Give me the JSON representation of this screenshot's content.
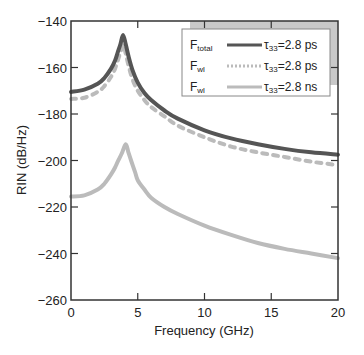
{
  "chart_data": {
    "type": "line",
    "title": "",
    "xlabel": "Frequency (GHz)",
    "ylabel": "RIN (dB/Hz)",
    "xlim": [
      0,
      20
    ],
    "ylim": [
      -260,
      -140
    ],
    "xticks": [
      0,
      5,
      10,
      15,
      20
    ],
    "yticks": [
      -140,
      -160,
      -180,
      -200,
      -220,
      -240,
      -260
    ],
    "xtick_labels": [
      "0",
      "5",
      "10",
      "15",
      "20"
    ],
    "ytick_labels": [
      "−140",
      "−160",
      "−180",
      "−200",
      "−220",
      "−240",
      "−260"
    ],
    "grid": false,
    "legend_position": "upper right",
    "series": [
      {
        "name": "F_total τ33=2.8 ps",
        "legend_symbol": "F",
        "legend_sub": "total",
        "legend_label": "τ33=2.8 ps",
        "color": "#555555",
        "style": "solid",
        "width": 4,
        "x": [
          0,
          1,
          2,
          2.5,
          3,
          3.3,
          3.5,
          3.7,
          3.9,
          4.1,
          4.3,
          4.6,
          5,
          5.5,
          6,
          7,
          8,
          10,
          12,
          14,
          16,
          18,
          20
        ],
        "y": [
          -170.5,
          -169.5,
          -167,
          -164.5,
          -160.5,
          -157,
          -153.5,
          -150,
          -146,
          -150,
          -155,
          -161,
          -166.5,
          -171,
          -174,
          -178.5,
          -182,
          -187,
          -190.5,
          -193,
          -195,
          -196.5,
          -197.5
        ]
      },
      {
        "name": "F_wl τ33=2.8 ps",
        "legend_symbol": "F",
        "legend_sub": "wl",
        "legend_label": "τ33=2.8 ps",
        "color": "#bbbbbb",
        "style": "dashed",
        "width": 4,
        "x": [
          0,
          1,
          2,
          2.5,
          3,
          3.3,
          3.5,
          3.7,
          3.9,
          4.1,
          4.3,
          4.6,
          5,
          5.5,
          6,
          7,
          8,
          10,
          12,
          14,
          16,
          18,
          20
        ],
        "y": [
          -173.5,
          -173,
          -170.5,
          -168,
          -164,
          -160.5,
          -157,
          -153.5,
          -150,
          -154,
          -159,
          -165,
          -170,
          -174,
          -177,
          -181,
          -185,
          -190,
          -194,
          -196.5,
          -198.5,
          -200.5,
          -202
        ]
      },
      {
        "name": "F_wl τ33=2.8 ns",
        "legend_symbol": "F",
        "legend_sub": "wl",
        "legend_label": "τ33=2.8 ns",
        "color": "#bbbbbb",
        "style": "solid",
        "width": 4,
        "x": [
          0,
          1,
          2,
          2.5,
          3,
          3.3,
          3.5,
          3.8,
          4.1,
          4.3,
          4.5,
          4.8,
          5,
          5.5,
          6,
          7,
          8,
          10,
          12,
          14,
          16,
          18,
          20
        ],
        "y": [
          -215.5,
          -215,
          -212.5,
          -210,
          -206,
          -203,
          -200.5,
          -197,
          -193,
          -196.5,
          -200,
          -205,
          -208.5,
          -212.5,
          -216,
          -220,
          -223,
          -228,
          -232,
          -235.5,
          -238,
          -240,
          -242
        ]
      }
    ]
  }
}
